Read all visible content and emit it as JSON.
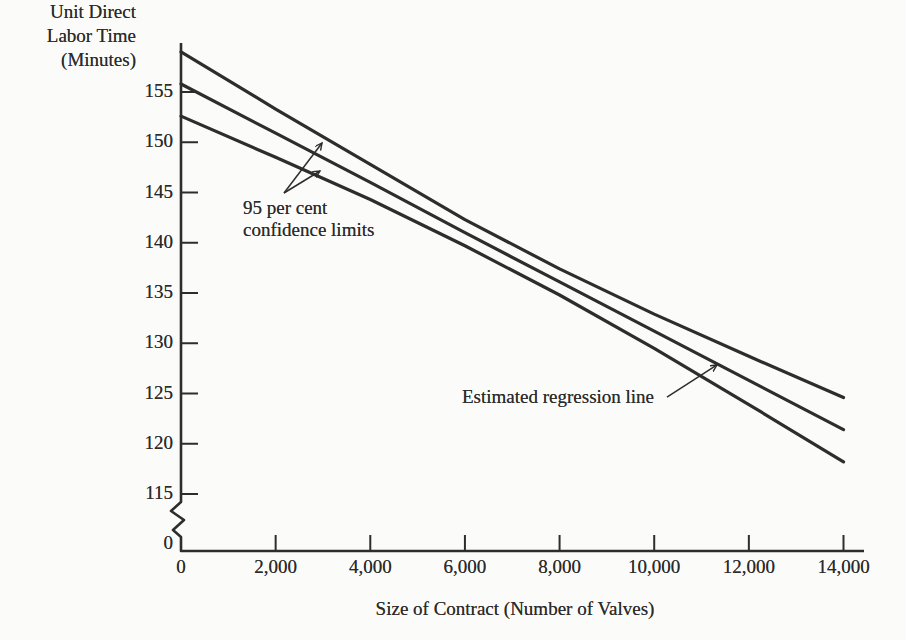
{
  "figure": {
    "background": "#fbfbf9",
    "ink_color": "#2d2d2d"
  },
  "chart_data": {
    "type": "line",
    "title": "",
    "ylabel": "Unit Direct Labor Time (Minutes)",
    "ylabel_display": "Unit Direct\nLabor Time\n(Minutes)",
    "xlabel": "Size of Contract (Number of Valves)",
    "x": [
      0,
      2000,
      4000,
      6000,
      8000,
      10000,
      12000,
      14000
    ],
    "x_tick_labels": [
      "0",
      "2,000",
      "4,000",
      "6,000",
      "8,000",
      "10,000",
      "12,000",
      "14,000"
    ],
    "y_ticks": [
      155,
      150,
      145,
      140,
      135,
      130,
      125,
      120,
      115
    ],
    "y_tick_labels": [
      "155",
      "150",
      "145",
      "140",
      "135",
      "130",
      "125",
      "120",
      "115"
    ],
    "y_origin_label": "0",
    "y_axis_break": true,
    "xlim": [
      0,
      14500
    ],
    "ylim": [
      115,
      160
    ],
    "grid": false,
    "legend": "none",
    "series": [
      {
        "name": "upper-95-percent-confidence-limit",
        "values": [
          159.0,
          153.3,
          147.8,
          142.3,
          137.4,
          132.9,
          128.7,
          124.6
        ]
      },
      {
        "name": "estimated-regression-line",
        "values": [
          155.8,
          150.9,
          146.0,
          141.0,
          136.1,
          131.2,
          126.3,
          121.4
        ]
      },
      {
        "name": "lower-95-percent-confidence-limit",
        "values": [
          152.6,
          148.5,
          144.3,
          139.7,
          134.8,
          129.5,
          123.9,
          118.2
        ]
      }
    ],
    "annotations": [
      {
        "id": "confidence-limits",
        "text": "95 per cent\nconfidence limits",
        "x": 1310,
        "y": 144.55,
        "arrow_origin": {
          "x": 2177,
          "y": 144.95
        },
        "arrow_tips": [
          {
            "x": 2980,
            "y": 149.93
          },
          {
            "x": 2937,
            "y": 147.14
          }
        ]
      },
      {
        "id": "regression-line",
        "text": "Estimated regression line",
        "x": 5938,
        "y": 125.75,
        "arrow_origin": {
          "x": 10270,
          "y": 124.65
        },
        "arrow_tips": [
          {
            "x": 11327,
            "y": 127.84
          }
        ]
      }
    ]
  }
}
